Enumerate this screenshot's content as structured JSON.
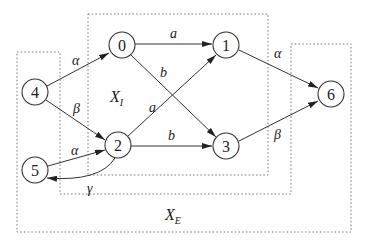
{
  "diagram": {
    "type": "state transition graph",
    "nodes": [
      {
        "id": "0",
        "label": "0",
        "x": 122,
        "y": 45
      },
      {
        "id": "1",
        "label": "1",
        "x": 226,
        "y": 45
      },
      {
        "id": "2",
        "label": "2",
        "x": 118,
        "y": 145
      },
      {
        "id": "3",
        "label": "3",
        "x": 226,
        "y": 146
      },
      {
        "id": "4",
        "label": "4",
        "x": 35,
        "y": 92
      },
      {
        "id": "5",
        "label": "5",
        "x": 35,
        "y": 170
      },
      {
        "id": "6",
        "label": "6",
        "x": 331,
        "y": 94
      }
    ],
    "edges": [
      {
        "from": "4",
        "to": "0",
        "label": "α"
      },
      {
        "from": "4",
        "to": "2",
        "label": "β"
      },
      {
        "from": "0",
        "to": "1",
        "label": "a"
      },
      {
        "from": "0",
        "to": "3",
        "label": "b"
      },
      {
        "from": "2",
        "to": "1",
        "label": "a"
      },
      {
        "from": "2",
        "to": "3",
        "label": "b"
      },
      {
        "from": "1",
        "to": "6",
        "label": "α"
      },
      {
        "from": "3",
        "to": "6",
        "label": "β"
      },
      {
        "from": "5",
        "to": "2",
        "label": "α"
      },
      {
        "from": "2",
        "to": "5",
        "label": "γ"
      }
    ],
    "regions": {
      "internal": {
        "label_main": "X",
        "label_sub": "I"
      },
      "external": {
        "label_main": "X",
        "label_sub": "E"
      }
    }
  }
}
